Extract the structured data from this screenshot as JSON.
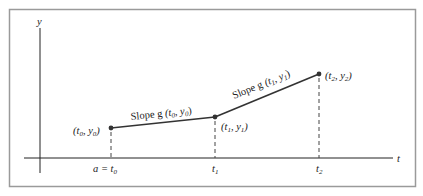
{
  "diagram": {
    "type": "piecewise-linear-euler-method",
    "axes": {
      "x_label": "t",
      "y_label": "y"
    },
    "points": [
      {
        "id": "p0",
        "label_t": "t",
        "label_t_sub": "0",
        "label_y": "y",
        "label_y_sub": "0",
        "x": 111,
        "y": 128
      },
      {
        "id": "p1",
        "label_t": "t",
        "label_t_sub": "1",
        "label_y": "y",
        "label_y_sub": "1",
        "x": 215,
        "y": 117
      },
      {
        "id": "p2",
        "label_t": "t",
        "label_t_sub": "2",
        "label_y": "y",
        "label_y_sub": "2",
        "x": 319,
        "y": 74
      }
    ],
    "segments": [
      {
        "from": "p0",
        "to": "p1",
        "label_prefix": "Slope g",
        "label_t_sub": "0",
        "label_y_sub": "0"
      },
      {
        "from": "p1",
        "to": "p2",
        "label_prefix": "Slope g",
        "label_t_sub": "1",
        "label_y_sub": "1"
      }
    ],
    "ticks": [
      {
        "label_prefix": "a = ",
        "label": "t",
        "sub": "0"
      },
      {
        "label_prefix": "",
        "label": "t",
        "sub": "1"
      },
      {
        "label_prefix": "",
        "label": "t",
        "sub": "2"
      }
    ],
    "colors": {
      "frame": "#9a9a9a",
      "line": "#222222",
      "point": "#333333"
    }
  }
}
